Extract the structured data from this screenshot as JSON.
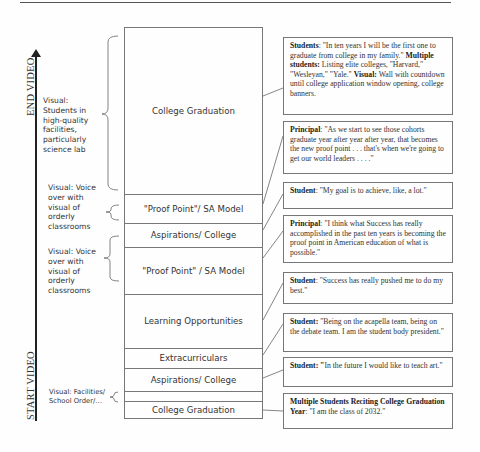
{
  "axis": {
    "end_label": "END VIDEO",
    "start_label": "START VIDEO"
  },
  "visual_labels": [
    {
      "text": "Visual: Students in high-quality facilities, particularly science lab"
    },
    {
      "text": "Visual: Voice over with visual of orderly classrooms"
    },
    {
      "text": "Visual: Voice over with visual of orderly classrooms"
    },
    {
      "text": "Visual: Facilities/ School Order/…"
    }
  ],
  "segments": [
    {
      "label": "College Graduation"
    },
    {
      "label": "\"Proof Point\"/ SA Model"
    },
    {
      "label": "Aspirations/ College"
    },
    {
      "label": "\"Proof Point\" / SA Model"
    },
    {
      "label": "Learning Opportunities"
    },
    {
      "label": "Extracurriculars"
    },
    {
      "label": "Aspirations/ College"
    },
    {
      "label": ""
    },
    {
      "label": "College Graduation"
    }
  ],
  "quotes": [
    {
      "parts": [
        {
          "b": "Students"
        },
        {
          "t": ": \"In ten years I will be the first one to graduate from college in my family.\" "
        },
        {
          "b": "Multiple students:"
        },
        {
          "t": " Listing elite colleges, \"Harvard,\" \"Wesleyan,\" \"Yale.\" "
        },
        {
          "b": "Visual:"
        },
        {
          "t": " Wall with countdown until college application window opening, college banners."
        }
      ]
    },
    {
      "parts": [
        {
          "b": "Principal"
        },
        {
          "t": ": \"As we start to see those cohorts graduate year after year after year, that becomes the new proof point . . . that's when we're going to get our world leaders . . . .\""
        }
      ]
    },
    {
      "parts": [
        {
          "b": "Student"
        },
        {
          "t": ": \"My goal is to achieve, like, a lot.\""
        }
      ]
    },
    {
      "parts": [
        {
          "b": "Principal"
        },
        {
          "t": ": \"I think what Success has really accomplished in the past ten years is becoming the proof point in American education of what is possible.\""
        }
      ]
    },
    {
      "parts": [
        {
          "b": "Student"
        },
        {
          "t": ": \"Success has really pushed me to do my best.\""
        }
      ]
    },
    {
      "parts": [
        {
          "b": "Student:"
        },
        {
          "t": " \"Being on the acapella team, being on the debate team. I am the student body president.\""
        }
      ]
    },
    {
      "parts": [
        {
          "b": "Student: \""
        },
        {
          "t": "In the future I would like to teach art.\""
        }
      ]
    },
    {
      "parts": [
        {
          "b": "Multiple Students Reciting College Graduation Year"
        },
        {
          "t": ": \"I am the class of 2032.\""
        }
      ]
    }
  ]
}
